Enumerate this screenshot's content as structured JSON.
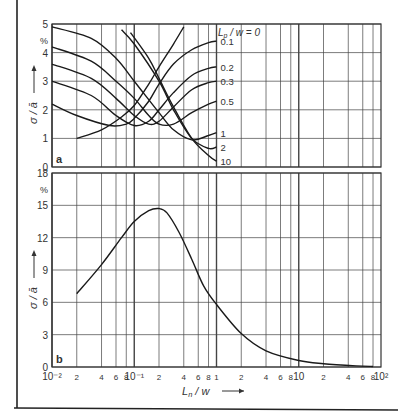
{
  "figure": {
    "panels": [
      "a",
      "b"
    ]
  },
  "chart_data": [
    {
      "panel": "a",
      "type": "line",
      "title": "",
      "xlabel": "L_n / w",
      "ylabel": "σ / ā",
      "y_unit": "%",
      "xscale": "log",
      "xlim": [
        0.01,
        100
      ],
      "ylim": [
        0,
        5
      ],
      "yticks": [
        0,
        1,
        2,
        3,
        4,
        5
      ],
      "grid": true,
      "legend_parameter": "L_p / w",
      "series": [
        {
          "name": "L_p/w = 0",
          "label": "L_p / w = 0",
          "x": [
            0.02,
            0.04,
            0.07,
            0.1,
            0.15,
            0.2,
            0.3,
            0.4
          ],
          "y": [
            1.0,
            1.3,
            1.75,
            2.15,
            2.9,
            3.5,
            4.3,
            4.9
          ]
        },
        {
          "name": "L_p/w = 0.1",
          "label": "0.1",
          "x": [
            0.01,
            0.02,
            0.05,
            0.08,
            0.1,
            0.15,
            0.2,
            0.3,
            0.5,
            0.8,
            1.0
          ],
          "y": [
            2.2,
            1.8,
            1.45,
            1.5,
            1.7,
            2.3,
            2.9,
            3.6,
            4.1,
            4.35,
            4.4
          ]
        },
        {
          "name": "L_p/w = 0.2",
          "label": "0.2",
          "x": [
            0.01,
            0.03,
            0.06,
            0.1,
            0.15,
            0.2,
            0.3,
            0.5,
            0.8,
            1.0
          ],
          "y": [
            3.0,
            2.5,
            1.8,
            1.45,
            1.6,
            2.0,
            2.6,
            3.2,
            3.45,
            3.5
          ]
        },
        {
          "name": "L_p/w = 0.3",
          "label": "0.3",
          "x": [
            0.01,
            0.03,
            0.06,
            0.1,
            0.15,
            0.2,
            0.3,
            0.5,
            0.8,
            1.0
          ],
          "y": [
            3.6,
            3.1,
            2.4,
            1.8,
            1.5,
            1.6,
            2.1,
            2.7,
            2.95,
            3.0
          ]
        },
        {
          "name": "L_p/w = 0.5",
          "label": "0.5",
          "x": [
            0.01,
            0.03,
            0.06,
            0.1,
            0.15,
            0.2,
            0.3,
            0.5,
            0.8,
            1.0
          ],
          "y": [
            4.2,
            3.7,
            3.0,
            2.4,
            1.8,
            1.5,
            1.5,
            1.9,
            2.2,
            2.3
          ]
        },
        {
          "name": "L_p/w = 1",
          "label": "1",
          "x": [
            0.01,
            0.03,
            0.06,
            0.1,
            0.2,
            0.3,
            0.5,
            0.8,
            1.0
          ],
          "y": [
            4.9,
            4.5,
            3.8,
            3.0,
            1.9,
            1.3,
            0.95,
            1.1,
            1.2
          ]
        },
        {
          "name": "L_p/w = 2",
          "label": "2",
          "x": [
            0.07,
            0.1,
            0.2,
            0.3,
            0.5,
            0.8,
            1.0
          ],
          "y": [
            4.8,
            4.3,
            3.0,
            2.0,
            1.0,
            0.65,
            0.7
          ]
        },
        {
          "name": "L_p/w = 10",
          "label": "10",
          "x": [
            0.09,
            0.15,
            0.2,
            0.3,
            0.5,
            0.8,
            1.0
          ],
          "y": [
            4.7,
            3.8,
            3.1,
            2.1,
            1.0,
            0.4,
            0.2
          ]
        }
      ]
    },
    {
      "panel": "b",
      "type": "line",
      "title": "",
      "xlabel": "L_n / w",
      "ylabel": "σ / ā",
      "y_unit": "%",
      "xscale": "log",
      "xlim": [
        0.01,
        100
      ],
      "ylim": [
        0,
        18
      ],
      "yticks": [
        0,
        3,
        6,
        9,
        12,
        15,
        18
      ],
      "xtick_labels": [
        "10⁻²",
        "2",
        "4",
        "6",
        "8",
        "10⁻¹",
        "2",
        "4",
        "6",
        "8",
        "1",
        "2",
        "4",
        "6",
        "8",
        "10",
        "2",
        "4",
        "6",
        "8",
        "10²"
      ],
      "grid": true,
      "series": [
        {
          "name": "σ/ā",
          "x": [
            0.02,
            0.04,
            0.07,
            0.1,
            0.15,
            0.2,
            0.25,
            0.35,
            0.5,
            0.7,
            1.0,
            2.0,
            4.0,
            10,
            20,
            50,
            80
          ],
          "y": [
            6.8,
            9.5,
            12.0,
            13.5,
            14.5,
            14.7,
            14.3,
            12.5,
            10.0,
            7.5,
            5.8,
            3.1,
            1.5,
            0.6,
            0.3,
            0.1,
            0.05
          ]
        }
      ]
    }
  ],
  "labels": {
    "panel_a_tag": "a",
    "panel_b_tag": "b",
    "ylabel": "σ / ā",
    "xlabel_main": "L",
    "xlabel_sub": "n",
    "xlabel_rest": " / w",
    "legend_main": "L",
    "legend_sub": "p",
    "legend_rest": " / w = 0",
    "unit": "%",
    "series_labels_a": [
      "0.1",
      "0.2",
      "0.3",
      "0.5",
      "1",
      "2",
      "10"
    ],
    "yticks_a": [
      "0",
      "1",
      "2",
      "3",
      "4",
      "5"
    ],
    "yticks_b": [
      "0",
      "3",
      "6",
      "9",
      "12",
      "15",
      "18"
    ]
  }
}
